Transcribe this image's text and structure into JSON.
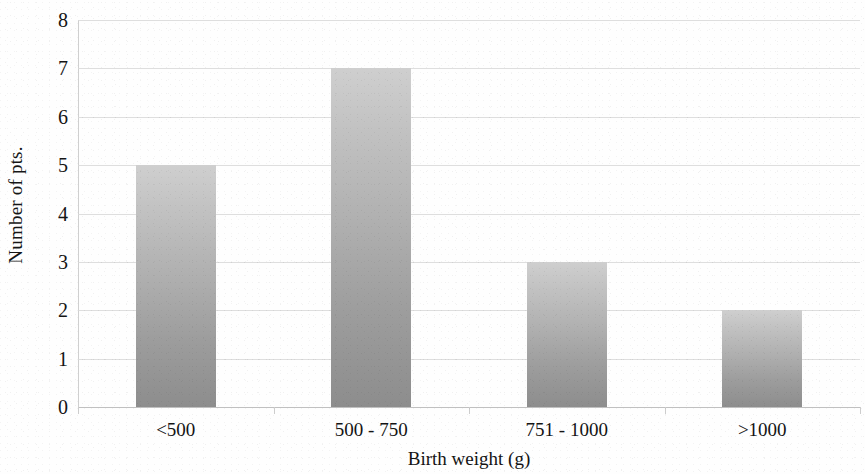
{
  "chart_data": {
    "type": "bar",
    "title": "",
    "categories": [
      "<500",
      "500 - 750",
      "751 - 1000",
      ">1000"
    ],
    "values": [
      5,
      7,
      3,
      2
    ],
    "xlabel": "Birth weight (g)",
    "ylabel": "Number of pts.",
    "ylim": [
      0,
      8
    ],
    "y_ticks": [
      8,
      7,
      6,
      5,
      4,
      3,
      2,
      1,
      0
    ],
    "grid": true,
    "legend": null,
    "bar_color_top": "#cfcfcf",
    "bar_color_bottom": "#8d8d8d",
    "gridline_color": "#d8d8d8",
    "axis_color": "#c0c0c0",
    "background": "#ffffff"
  }
}
